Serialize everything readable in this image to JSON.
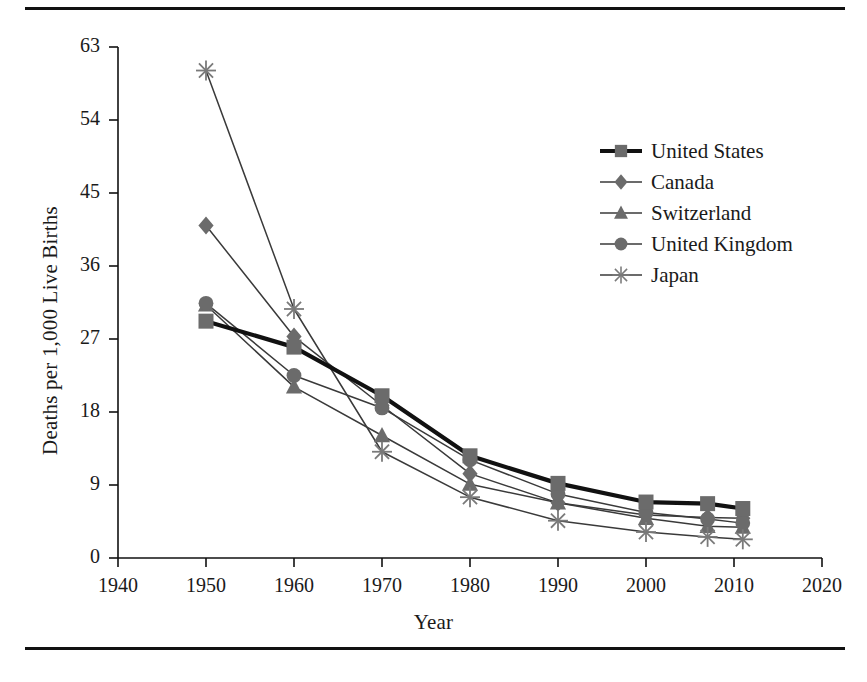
{
  "figure": {
    "has_top_rule": true,
    "has_bottom_rule": true,
    "line_color": "#111111"
  },
  "chart_data": {
    "type": "line",
    "title": "",
    "xlabel": "Year",
    "ylabel": "Deaths per 1,000 Live Births",
    "xlim": [
      1940,
      2020
    ],
    "ylim": [
      0,
      63
    ],
    "xticks": [
      1940,
      1950,
      1960,
      1970,
      1980,
      1990,
      2000,
      2010,
      2020
    ],
    "yticks": [
      0,
      9,
      18,
      27,
      36,
      45,
      54,
      63
    ],
    "grid": false,
    "legend_position": "upper right",
    "series": [
      {
        "name": "United States",
        "marker": "square",
        "emphasis": true,
        "color": "#6b6b6b",
        "line_color": "#111111",
        "line_width": 4.2,
        "x": [
          1950,
          1960,
          1970,
          1980,
          1990,
          2000,
          2007,
          2011
        ],
        "y": [
          29.2,
          26.0,
          20.0,
          12.6,
          9.2,
          6.9,
          6.7,
          6.1
        ]
      },
      {
        "name": "Canada",
        "marker": "diamond",
        "emphasis": false,
        "color": "#6b6b6b",
        "line_color": "#3a3a3a",
        "line_width": 1.5,
        "x": [
          1950,
          1960,
          1970,
          1980,
          1990,
          2000,
          2007,
          2011
        ],
        "y": [
          41.0,
          27.3,
          18.8,
          10.4,
          6.8,
          5.3,
          5.0,
          4.9
        ]
      },
      {
        "name": "Switzerland",
        "marker": "triangle",
        "emphasis": false,
        "color": "#6b6b6b",
        "line_color": "#3a3a3a",
        "line_width": 1.5,
        "x": [
          1950,
          1960,
          1970,
          1980,
          1990,
          2000,
          2007,
          2011
        ],
        "y": [
          31.2,
          21.1,
          15.1,
          9.1,
          6.8,
          4.9,
          3.9,
          3.8
        ]
      },
      {
        "name": "United Kingdom",
        "marker": "circle",
        "emphasis": false,
        "color": "#6b6b6b",
        "line_color": "#3a3a3a",
        "line_width": 1.5,
        "x": [
          1950,
          1960,
          1970,
          1980,
          1990,
          2000,
          2007,
          2011
        ],
        "y": [
          31.4,
          22.5,
          18.5,
          12.1,
          7.9,
          5.6,
          4.8,
          4.3
        ]
      },
      {
        "name": "Japan",
        "marker": "asterisk",
        "emphasis": false,
        "color": "#7a7a7a",
        "line_color": "#3a3a3a",
        "line_width": 1.5,
        "x": [
          1950,
          1960,
          1970,
          1980,
          1990,
          2000,
          2007,
          2011
        ],
        "y": [
          60.1,
          30.7,
          13.1,
          7.5,
          4.6,
          3.2,
          2.6,
          2.3
        ]
      }
    ]
  }
}
